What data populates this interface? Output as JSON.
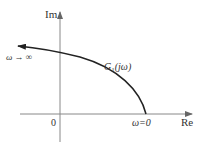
{
  "diagram": {
    "type": "nyquist-plot",
    "axes": {
      "imag_label": "Im",
      "real_label": "Re",
      "origin_label": "0"
    },
    "curve": {
      "name": "G",
      "subscript": "1",
      "arg": "(jω)",
      "start_label": "ω=0",
      "end_label": "ω → ∞"
    },
    "colors": {
      "axis": "#888888",
      "curve": "#222222",
      "text": "#333333",
      "background": "#ffffff"
    }
  }
}
